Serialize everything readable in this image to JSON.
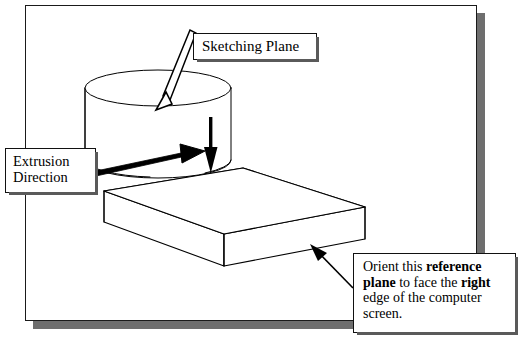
{
  "figure": {
    "type": "technical-illustration",
    "background_color": "#ffffff",
    "line_color": "#000000",
    "shadow_color": "#6e6e6e"
  },
  "frame": {
    "border_color": "#1a1a1a",
    "shadow_color": "#6e6e6e"
  },
  "callouts": {
    "sketching_plane": {
      "text": "Sketching Plane",
      "arrow": "outlined-arrow-down-left"
    },
    "extrusion_direction": {
      "line1": "Extrusion",
      "line2": "Direction",
      "arrow": "thin-double-line-arrow-right"
    },
    "orient_reference_plane": {
      "line1_pre": "Orient this ",
      "line1_bold": "reference",
      "line2_bold": "plane",
      "line2_mid": " to face the ",
      "line2_bold2": "right",
      "line3": "edge of the computer",
      "line4": "screen.",
      "arrow": "solid-arrow-up-left"
    }
  },
  "geometry": {
    "cylinder": {
      "name": "cylinder-boss",
      "top_ellipse_center_x": 158,
      "top_ellipse_center_y": 88,
      "radius_x": 73,
      "radius_y": 18,
      "height": 95
    },
    "base_block": {
      "name": "rectangular-base-plate",
      "thickness": 33
    },
    "extrusion_arrow": {
      "name": "extrusion-direction-arrow",
      "direction": "downward",
      "color": "#000000"
    }
  }
}
